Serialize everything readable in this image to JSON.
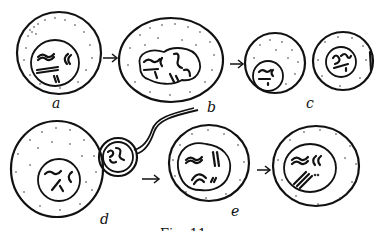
{
  "figure": {
    "caption": "Fig. 11",
    "labels": {
      "a": "a",
      "b": "b",
      "c": "c",
      "d": "d",
      "e": "e"
    },
    "stages": [
      {
        "id": "a",
        "description": "cell with nucleus showing paired chromosomes"
      },
      {
        "id": "b",
        "description": "enlarged cell with elongated nucleus and scattered chromosomes"
      },
      {
        "id": "c",
        "description": "two daughter cells with small nuclei"
      },
      {
        "id": "d",
        "description": "large cell with attached small cell bearing a flagellum-like tail"
      },
      {
        "id": "e",
        "description": "cell with nucleus showing paired chromosomes, followed by next stage"
      }
    ],
    "colors": {
      "ink": "#111111",
      "background": "#ffffff"
    }
  }
}
